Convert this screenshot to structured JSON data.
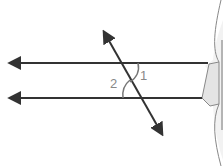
{
  "diagram": {
    "type": "parallel-lines-transversal",
    "angle_labels": {
      "angle1": "1",
      "angle2": "2"
    },
    "colors": {
      "line": "#333333",
      "label": "#888888",
      "shape_fill": "#e4e4e4",
      "shape_stroke": "#777777"
    }
  }
}
